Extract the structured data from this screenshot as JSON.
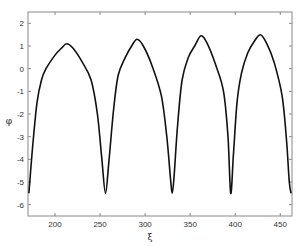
{
  "chart_data": {
    "type": "line",
    "title": "",
    "xlabel": "ξ",
    "ylabel": "φ",
    "xlim": [
      170,
      463
    ],
    "ylim": [
      -6.5,
      2.5
    ],
    "xticks": [
      200,
      250,
      300,
      350,
      400,
      450
    ],
    "yticks": [
      2,
      1,
      0,
      -1,
      -2,
      -3,
      -4,
      -5,
      -6
    ],
    "grid": false,
    "legend": null,
    "series": [
      {
        "name": "phi",
        "color": "#111111",
        "x": [
          171,
          175,
          180,
          185,
          190,
          200,
          207,
          213,
          220,
          230,
          240,
          247,
          252,
          256,
          260,
          265,
          270,
          278,
          285,
          291,
          298,
          308,
          318,
          324,
          328,
          330,
          332,
          336,
          341,
          348,
          355,
          362,
          369,
          378,
          387,
          392,
          395,
          398,
          402,
          407,
          414,
          421,
          428,
          435,
          443,
          452,
          457,
          460,
          462
        ],
        "y": [
          -5.5,
          -3.5,
          -1.5,
          -0.5,
          0.0,
          0.6,
          0.9,
          1.1,
          0.9,
          0.3,
          -0.5,
          -2.0,
          -4.0,
          -5.5,
          -4.0,
          -1.8,
          -0.3,
          0.5,
          1.0,
          1.3,
          1.0,
          0.1,
          -1.2,
          -3.0,
          -4.8,
          -5.5,
          -4.8,
          -2.5,
          -0.5,
          0.5,
          1.0,
          1.45,
          1.1,
          0.2,
          -1.0,
          -3.0,
          -5.5,
          -3.8,
          -1.5,
          -0.2,
          0.7,
          1.2,
          1.5,
          1.1,
          0.3,
          -1.2,
          -3.2,
          -5.0,
          -5.5
        ]
      }
    ],
    "minima_approx": [
      {
        "x": 171,
        "y": -5.5
      },
      {
        "x": 256,
        "y": -5.5
      },
      {
        "x": 330,
        "y": -5.5
      },
      {
        "x": 395,
        "y": -5.5
      },
      {
        "x": 461,
        "y": -5.5
      }
    ],
    "maxima_approx": [
      {
        "x": 213,
        "y": 1.1
      },
      {
        "x": 291,
        "y": 1.3
      },
      {
        "x": 362,
        "y": 1.45
      },
      {
        "x": 428,
        "y": 1.5
      }
    ]
  },
  "colors": {
    "axis": "#555555",
    "line": "#111111",
    "background": "#ffffff"
  }
}
